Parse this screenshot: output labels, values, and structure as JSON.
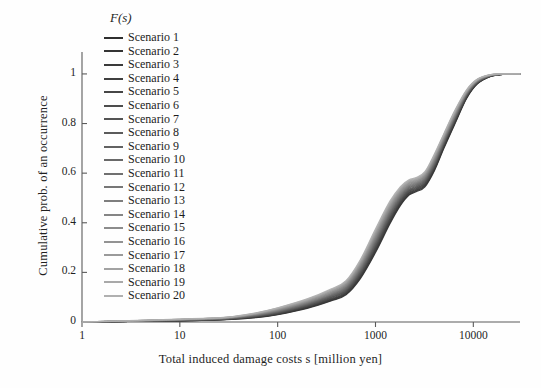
{
  "chart_data": {
    "type": "line",
    "title": "",
    "xlabel": "Total induced damage costs s  [million yen]",
    "ylabel": "Cumulative prob. of an occurrence",
    "y_axis_symbol": "F(s)",
    "xscale": "log",
    "xlim": [
      1,
      30000
    ],
    "ylim": [
      0,
      1.04
    ],
    "xticks": [
      1,
      10,
      100,
      1000,
      10000
    ],
    "xtick_labels": [
      "1",
      "10",
      "100",
      "1000",
      "10000"
    ],
    "yticks": [
      0,
      0.2,
      0.4,
      0.6,
      0.8,
      1
    ],
    "ytick_labels": [
      "0",
      "0.2",
      "0.4",
      "0.6",
      "0.8",
      "1"
    ],
    "grid": false,
    "legend_position": "upper-left-inside",
    "series": [
      {
        "name": "Scenario 1",
        "color": "#2f2f2f",
        "x": [
          1,
          3,
          10,
          30,
          60,
          100,
          200,
          350,
          500,
          700,
          1000,
          1400,
          1800,
          2200,
          2600,
          3200,
          4000,
          5000,
          6500,
          8500,
          11000,
          15000,
          20000,
          30000
        ],
        "y": [
          0.0,
          0.002,
          0.005,
          0.01,
          0.018,
          0.03,
          0.055,
          0.085,
          0.11,
          0.175,
          0.28,
          0.395,
          0.47,
          0.512,
          0.525,
          0.545,
          0.61,
          0.7,
          0.8,
          0.9,
          0.96,
          0.99,
          0.998,
          1.0
        ]
      },
      {
        "name": "Scenario 2",
        "color": "#343434",
        "x": [
          1,
          3,
          10,
          30,
          60,
          100,
          200,
          350,
          500,
          700,
          1000,
          1400,
          1800,
          2200,
          2600,
          3200,
          4000,
          5000,
          6500,
          8500,
          11000,
          15000,
          20000,
          30000
        ],
        "y": [
          0.0,
          0.002,
          0.005,
          0.011,
          0.019,
          0.031,
          0.057,
          0.087,
          0.113,
          0.179,
          0.285,
          0.4,
          0.474,
          0.515,
          0.528,
          0.549,
          0.614,
          0.704,
          0.803,
          0.902,
          0.961,
          0.99,
          0.998,
          1.0
        ]
      },
      {
        "name": "Scenario 3",
        "color": "#3a3a3a",
        "x": [
          1,
          3,
          10,
          30,
          60,
          100,
          200,
          350,
          500,
          700,
          1000,
          1400,
          1800,
          2200,
          2600,
          3200,
          4000,
          5000,
          6500,
          8500,
          11000,
          15000,
          20000,
          30000
        ],
        "y": [
          0.0,
          0.002,
          0.006,
          0.011,
          0.02,
          0.032,
          0.059,
          0.09,
          0.116,
          0.183,
          0.29,
          0.405,
          0.478,
          0.519,
          0.531,
          0.552,
          0.617,
          0.707,
          0.806,
          0.904,
          0.962,
          0.991,
          0.998,
          1.0
        ]
      },
      {
        "name": "Scenario 4",
        "color": "#3f3f3f",
        "x": [
          1,
          3,
          10,
          30,
          60,
          100,
          200,
          350,
          500,
          700,
          1000,
          1400,
          1800,
          2200,
          2600,
          3200,
          4000,
          5000,
          6500,
          8500,
          11000,
          15000,
          20000,
          30000
        ],
        "y": [
          0.0,
          0.002,
          0.006,
          0.012,
          0.021,
          0.033,
          0.061,
          0.092,
          0.119,
          0.187,
          0.295,
          0.41,
          0.482,
          0.522,
          0.534,
          0.556,
          0.621,
          0.711,
          0.809,
          0.906,
          0.963,
          0.991,
          0.998,
          1.0
        ]
      },
      {
        "name": "Scenario 5",
        "color": "#464646",
        "x": [
          1,
          3,
          10,
          30,
          60,
          100,
          200,
          350,
          500,
          700,
          1000,
          1400,
          1800,
          2200,
          2600,
          3200,
          4000,
          5000,
          6500,
          8500,
          11000,
          15000,
          20000,
          30000
        ],
        "y": [
          0.0,
          0.003,
          0.006,
          0.012,
          0.022,
          0.035,
          0.063,
          0.095,
          0.122,
          0.191,
          0.3,
          0.415,
          0.486,
          0.526,
          0.537,
          0.559,
          0.624,
          0.714,
          0.812,
          0.908,
          0.964,
          0.992,
          0.999,
          1.0
        ]
      },
      {
        "name": "Scenario 6",
        "color": "#4d4d4d",
        "x": [
          1,
          3,
          10,
          30,
          60,
          100,
          200,
          350,
          500,
          700,
          1000,
          1400,
          1800,
          2200,
          2600,
          3200,
          4000,
          5000,
          6500,
          8500,
          11000,
          15000,
          20000,
          30000
        ],
        "y": [
          0.0,
          0.003,
          0.007,
          0.013,
          0.023,
          0.036,
          0.065,
          0.098,
          0.125,
          0.195,
          0.305,
          0.42,
          0.49,
          0.529,
          0.54,
          0.562,
          0.628,
          0.717,
          0.815,
          0.91,
          0.965,
          0.992,
          0.999,
          1.0
        ]
      },
      {
        "name": "Scenario 7",
        "color": "#545454",
        "x": [
          1,
          3,
          10,
          30,
          60,
          100,
          200,
          350,
          500,
          700,
          1000,
          1400,
          1800,
          2200,
          2600,
          3200,
          4000,
          5000,
          6500,
          8500,
          11000,
          15000,
          20000,
          30000
        ],
        "y": [
          0.0,
          0.003,
          0.007,
          0.013,
          0.024,
          0.038,
          0.067,
          0.1,
          0.128,
          0.199,
          0.31,
          0.425,
          0.494,
          0.532,
          0.543,
          0.566,
          0.631,
          0.72,
          0.818,
          0.912,
          0.966,
          0.993,
          0.999,
          1.0
        ]
      },
      {
        "name": "Scenario 8",
        "color": "#5b5b5b",
        "x": [
          1,
          3,
          10,
          30,
          60,
          100,
          200,
          350,
          500,
          700,
          1000,
          1400,
          1800,
          2200,
          2600,
          3200,
          4000,
          5000,
          6500,
          8500,
          11000,
          15000,
          20000,
          30000
        ],
        "y": [
          0.0,
          0.003,
          0.007,
          0.014,
          0.025,
          0.039,
          0.069,
          0.103,
          0.131,
          0.203,
          0.315,
          0.43,
          0.498,
          0.535,
          0.546,
          0.569,
          0.635,
          0.723,
          0.82,
          0.913,
          0.967,
          0.993,
          0.999,
          1.0
        ]
      },
      {
        "name": "Scenario 9",
        "color": "#626262",
        "x": [
          1,
          3,
          10,
          30,
          60,
          100,
          200,
          350,
          500,
          700,
          1000,
          1400,
          1800,
          2200,
          2600,
          3200,
          4000,
          5000,
          6500,
          8500,
          11000,
          15000,
          20000,
          30000
        ],
        "y": [
          0.0,
          0.003,
          0.008,
          0.014,
          0.026,
          0.041,
          0.071,
          0.105,
          0.134,
          0.207,
          0.32,
          0.434,
          0.502,
          0.539,
          0.549,
          0.572,
          0.638,
          0.726,
          0.823,
          0.915,
          0.968,
          0.993,
          0.999,
          1.0
        ]
      },
      {
        "name": "Scenario 10",
        "color": "#696969",
        "x": [
          1,
          3,
          10,
          30,
          60,
          100,
          200,
          350,
          500,
          700,
          1000,
          1400,
          1800,
          2200,
          2600,
          3200,
          4000,
          5000,
          6500,
          8500,
          11000,
          15000,
          20000,
          30000
        ],
        "y": [
          0.0,
          0.003,
          0.008,
          0.015,
          0.027,
          0.042,
          0.073,
          0.108,
          0.137,
          0.211,
          0.325,
          0.439,
          0.506,
          0.542,
          0.552,
          0.575,
          0.642,
          0.729,
          0.826,
          0.917,
          0.969,
          0.994,
          0.999,
          1.0
        ]
      },
      {
        "name": "Scenario 11",
        "color": "#707070",
        "x": [
          1,
          3,
          10,
          30,
          60,
          100,
          200,
          350,
          500,
          700,
          1000,
          1400,
          1800,
          2200,
          2600,
          3200,
          4000,
          5000,
          6500,
          8500,
          11000,
          15000,
          20000,
          30000
        ],
        "y": [
          0.0,
          0.004,
          0.008,
          0.015,
          0.028,
          0.044,
          0.075,
          0.11,
          0.14,
          0.215,
          0.33,
          0.444,
          0.51,
          0.545,
          0.555,
          0.578,
          0.645,
          0.732,
          0.829,
          0.919,
          0.97,
          0.994,
          0.999,
          1.0
        ]
      },
      {
        "name": "Scenario 12",
        "color": "#777777",
        "x": [
          1,
          3,
          10,
          30,
          60,
          100,
          200,
          350,
          500,
          700,
          1000,
          1400,
          1800,
          2200,
          2600,
          3200,
          4000,
          5000,
          6500,
          8500,
          11000,
          15000,
          20000,
          30000
        ],
        "y": [
          0.0,
          0.004,
          0.009,
          0.016,
          0.029,
          0.045,
          0.077,
          0.113,
          0.143,
          0.219,
          0.335,
          0.448,
          0.514,
          0.548,
          0.558,
          0.581,
          0.649,
          0.735,
          0.832,
          0.92,
          0.971,
          0.994,
          0.999,
          1.0
        ]
      },
      {
        "name": "Scenario 13",
        "color": "#7e7e7e",
        "x": [
          1,
          3,
          10,
          30,
          60,
          100,
          200,
          350,
          500,
          700,
          1000,
          1400,
          1800,
          2200,
          2600,
          3200,
          4000,
          5000,
          6500,
          8500,
          11000,
          15000,
          20000,
          30000
        ],
        "y": [
          0.0,
          0.004,
          0.009,
          0.016,
          0.03,
          0.047,
          0.079,
          0.115,
          0.146,
          0.223,
          0.34,
          0.453,
          0.518,
          0.551,
          0.561,
          0.585,
          0.652,
          0.738,
          0.834,
          0.922,
          0.972,
          0.995,
          0.999,
          1.0
        ]
      },
      {
        "name": "Scenario 14",
        "color": "#858585",
        "x": [
          1,
          3,
          10,
          30,
          60,
          100,
          200,
          350,
          500,
          700,
          1000,
          1400,
          1800,
          2200,
          2600,
          3200,
          4000,
          5000,
          6500,
          8500,
          11000,
          15000,
          20000,
          30000
        ],
        "y": [
          0.0,
          0.004,
          0.009,
          0.017,
          0.031,
          0.048,
          0.081,
          0.118,
          0.149,
          0.227,
          0.345,
          0.458,
          0.522,
          0.554,
          0.564,
          0.588,
          0.656,
          0.741,
          0.837,
          0.924,
          0.973,
          0.995,
          0.999,
          1.0
        ]
      },
      {
        "name": "Scenario 15",
        "color": "#8c8c8c",
        "x": [
          1,
          3,
          10,
          30,
          60,
          100,
          200,
          350,
          500,
          700,
          1000,
          1400,
          1800,
          2200,
          2600,
          3200,
          4000,
          5000,
          6500,
          8500,
          11000,
          15000,
          20000,
          30000
        ],
        "y": [
          0.0,
          0.004,
          0.01,
          0.017,
          0.032,
          0.05,
          0.083,
          0.12,
          0.152,
          0.231,
          0.35,
          0.462,
          0.526,
          0.558,
          0.567,
          0.591,
          0.659,
          0.744,
          0.84,
          0.926,
          0.974,
          0.995,
          0.999,
          1.0
        ]
      },
      {
        "name": "Scenario 16",
        "color": "#939393",
        "x": [
          1,
          3,
          10,
          30,
          60,
          100,
          200,
          350,
          500,
          700,
          1000,
          1400,
          1800,
          2200,
          2600,
          3200,
          4000,
          5000,
          6500,
          8500,
          11000,
          15000,
          20000,
          30000
        ],
        "y": [
          0.0,
          0.005,
          0.01,
          0.018,
          0.033,
          0.051,
          0.085,
          0.123,
          0.155,
          0.235,
          0.355,
          0.467,
          0.53,
          0.561,
          0.57,
          0.594,
          0.663,
          0.747,
          0.843,
          0.927,
          0.975,
          0.996,
          0.999,
          1.0
        ]
      },
      {
        "name": "Scenario 17",
        "color": "#9a9a9a",
        "x": [
          1,
          3,
          10,
          30,
          60,
          100,
          200,
          350,
          500,
          700,
          1000,
          1400,
          1800,
          2200,
          2600,
          3200,
          4000,
          5000,
          6500,
          8500,
          11000,
          15000,
          20000,
          30000
        ],
        "y": [
          0.0,
          0.005,
          0.011,
          0.018,
          0.034,
          0.053,
          0.087,
          0.125,
          0.158,
          0.239,
          0.36,
          0.472,
          0.534,
          0.564,
          0.573,
          0.597,
          0.666,
          0.75,
          0.846,
          0.929,
          0.976,
          0.996,
          0.999,
          1.0
        ]
      },
      {
        "name": "Scenario 18",
        "color": "#a2a2a2",
        "x": [
          1,
          3,
          10,
          30,
          60,
          100,
          200,
          350,
          500,
          700,
          1000,
          1400,
          1800,
          2200,
          2600,
          3200,
          4000,
          5000,
          6500,
          8500,
          11000,
          15000,
          20000,
          30000
        ],
        "y": [
          0.0,
          0.005,
          0.011,
          0.019,
          0.035,
          0.054,
          0.089,
          0.128,
          0.161,
          0.243,
          0.365,
          0.476,
          0.538,
          0.567,
          0.576,
          0.6,
          0.67,
          0.753,
          0.848,
          0.931,
          0.977,
          0.996,
          0.999,
          1.0
        ]
      },
      {
        "name": "Scenario 19",
        "color": "#a9a9a9",
        "x": [
          1,
          3,
          10,
          30,
          60,
          100,
          200,
          350,
          500,
          700,
          1000,
          1400,
          1800,
          2200,
          2600,
          3200,
          4000,
          5000,
          6500,
          8500,
          11000,
          15000,
          20000,
          30000
        ],
        "y": [
          0.0,
          0.005,
          0.011,
          0.019,
          0.036,
          0.056,
          0.091,
          0.13,
          0.164,
          0.247,
          0.37,
          0.481,
          0.542,
          0.57,
          0.579,
          0.603,
          0.673,
          0.756,
          0.851,
          0.933,
          0.978,
          0.997,
          1.0,
          1.0
        ]
      },
      {
        "name": "Scenario 20",
        "color": "#b0b0b0",
        "x": [
          1,
          3,
          10,
          30,
          60,
          100,
          200,
          350,
          500,
          700,
          1000,
          1400,
          1800,
          2200,
          2600,
          3200,
          4000,
          5000,
          6500,
          8500,
          11000,
          15000,
          20000,
          30000
        ],
        "y": [
          0.0,
          0.006,
          0.012,
          0.02,
          0.037,
          0.057,
          0.093,
          0.133,
          0.167,
          0.251,
          0.375,
          0.486,
          0.546,
          0.573,
          0.582,
          0.606,
          0.677,
          0.759,
          0.854,
          0.935,
          0.979,
          0.997,
          1.0,
          1.0
        ]
      }
    ]
  },
  "axis_color": "#5a5a5a"
}
